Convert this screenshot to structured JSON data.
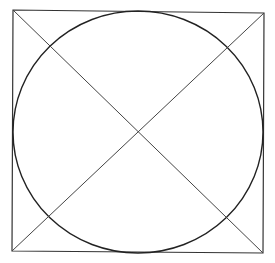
{
  "figure": {
    "stroke_color": "#333333",
    "background": "#ffffff",
    "square": {
      "corners": [
        [
          13,
          10
        ],
        [
          264,
          13
        ],
        [
          263,
          253
        ],
        [
          12,
          251
        ]
      ]
    },
    "circle": {
      "cx": 138,
      "cy": 132,
      "rx": 125,
      "ry": 121
    },
    "diagonals": [
      {
        "from": [
          13,
          10
        ],
        "to": [
          263,
          253
        ]
      },
      {
        "from": [
          12,
          251
        ],
        "to": [
          264,
          13
        ]
      }
    ]
  }
}
